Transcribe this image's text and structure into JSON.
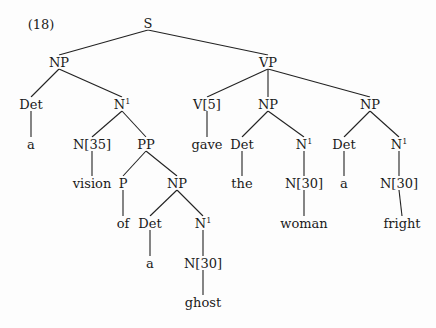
{
  "example_number": "(18)",
  "nodes": [
    {
      "id": "S",
      "label": "S",
      "x": 148,
      "y": 23
    },
    {
      "id": "NP1",
      "label": "NP",
      "x": 59,
      "y": 62
    },
    {
      "id": "VP",
      "label": "VP",
      "x": 268,
      "y": 62
    },
    {
      "id": "Det1",
      "label": "Det",
      "x": 31,
      "y": 104
    },
    {
      "id": "N1a",
      "label": "N",
      "sup": "1",
      "x": 122,
      "y": 104
    },
    {
      "id": "V5",
      "label": "V[5]",
      "x": 207,
      "y": 104
    },
    {
      "id": "NP2",
      "label": "NP",
      "x": 268,
      "y": 104
    },
    {
      "id": "NP3",
      "label": "NP",
      "x": 370,
      "y": 104
    },
    {
      "id": "a1",
      "label": "a",
      "x": 31,
      "y": 144
    },
    {
      "id": "N35",
      "label": "N[35]",
      "x": 92,
      "y": 144
    },
    {
      "id": "PP",
      "label": "PP",
      "x": 146,
      "y": 144
    },
    {
      "id": "gave",
      "label": "gave",
      "x": 207,
      "y": 144
    },
    {
      "id": "Det2",
      "label": "Det",
      "x": 242,
      "y": 144
    },
    {
      "id": "N1b",
      "label": "N",
      "sup": "1",
      "x": 304,
      "y": 144
    },
    {
      "id": "Det3",
      "label": "Det",
      "x": 344,
      "y": 144
    },
    {
      "id": "N1c",
      "label": "N",
      "sup": "1",
      "x": 399,
      "y": 144
    },
    {
      "id": "vision",
      "label": "vision",
      "x": 92,
      "y": 183
    },
    {
      "id": "P",
      "label": "P",
      "x": 123,
      "y": 183
    },
    {
      "id": "NP4",
      "label": "NP",
      "x": 177,
      "y": 183
    },
    {
      "id": "the",
      "label": "the",
      "x": 242,
      "y": 183
    },
    {
      "id": "N30a",
      "label": "N[30]",
      "x": 304,
      "y": 183
    },
    {
      "id": "a2",
      "label": "a",
      "x": 344,
      "y": 183
    },
    {
      "id": "N30b",
      "label": "N[30]",
      "x": 399,
      "y": 183
    },
    {
      "id": "of",
      "label": "of",
      "x": 123,
      "y": 223
    },
    {
      "id": "Det4",
      "label": "Det",
      "x": 150,
      "y": 223
    },
    {
      "id": "N1d",
      "label": "N",
      "sup": "1",
      "x": 203,
      "y": 223
    },
    {
      "id": "woman",
      "label": "woman",
      "x": 304,
      "y": 223
    },
    {
      "id": "fright",
      "label": "fright",
      "x": 402,
      "y": 223
    },
    {
      "id": "a3",
      "label": "a",
      "x": 150,
      "y": 263
    },
    {
      "id": "N30c",
      "label": "N[30]",
      "x": 203,
      "y": 263
    },
    {
      "id": "ghost",
      "label": "ghost",
      "x": 203,
      "y": 302
    }
  ],
  "edges": [
    [
      "S",
      "NP1"
    ],
    [
      "S",
      "VP"
    ],
    [
      "NP1",
      "Det1"
    ],
    [
      "NP1",
      "N1a"
    ],
    [
      "VP",
      "V5"
    ],
    [
      "VP",
      "NP2"
    ],
    [
      "VP",
      "NP3"
    ],
    [
      "Det1",
      "a1"
    ],
    [
      "N1a",
      "N35"
    ],
    [
      "N1a",
      "PP"
    ],
    [
      "V5",
      "gave"
    ],
    [
      "NP2",
      "Det2"
    ],
    [
      "NP2",
      "N1b"
    ],
    [
      "NP3",
      "Det3"
    ],
    [
      "NP3",
      "N1c"
    ],
    [
      "N35",
      "vision"
    ],
    [
      "PP",
      "P"
    ],
    [
      "PP",
      "NP4"
    ],
    [
      "Det2",
      "the"
    ],
    [
      "N1b",
      "N30a"
    ],
    [
      "Det3",
      "a2"
    ],
    [
      "N1c",
      "N30b"
    ],
    [
      "P",
      "of"
    ],
    [
      "NP4",
      "Det4"
    ],
    [
      "NP4",
      "N1d"
    ],
    [
      "N30a",
      "woman"
    ],
    [
      "N30b",
      "fright"
    ],
    [
      "Det4",
      "a3"
    ],
    [
      "N1d",
      "N30c"
    ],
    [
      "N30c",
      "ghost"
    ]
  ]
}
